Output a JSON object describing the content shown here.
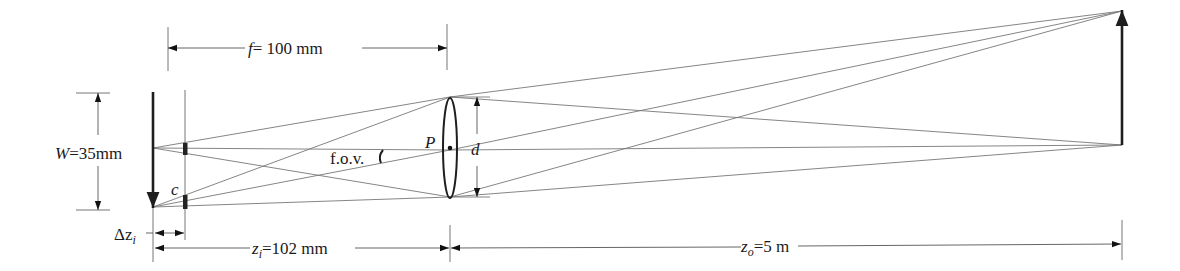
{
  "diagram": {
    "type": "thin-lens optics diagram (camera depth of field / field of view)",
    "labels": {
      "focal_length": "= 100 mm",
      "focal_length_symbol": "f",
      "sensor_width_symbol": "W",
      "sensor_width": "=35mm",
      "principal_point": "P",
      "aperture_diameter": "d",
      "circle_of_confusion": "c",
      "field_of_view": "f.o.v.",
      "delta_image_distance_symbol": "Δz",
      "delta_image_distance_sub": "i",
      "image_distance_symbol": "z",
      "image_distance_sub": "i",
      "image_distance": "=102 mm",
      "object_distance_symbol": "z",
      "object_distance_sub": "o",
      "object_distance": "=5 m"
    },
    "values": {
      "f_mm": 100,
      "W_mm": 35,
      "z_i_mm": 102,
      "z_o_m": 5
    },
    "elements": [
      "image-arrow (inverted, at sensor)",
      "focal-plane line with blur spots c",
      "thin lens with principal point P and aperture d",
      "object arrow (upright, far right)",
      "light rays from object through lens to image",
      "dimension lines for f, W, Δz_i, z_i, z_o"
    ],
    "colors": {
      "lines": "#1e1e1e",
      "rays": "#777777",
      "background": "#ffffff"
    }
  }
}
